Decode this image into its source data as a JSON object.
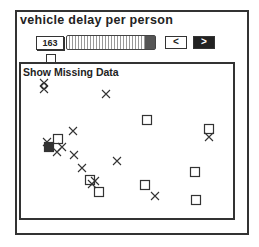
{
  "panel": {
    "title": "vehicle delay per person",
    "value": "163",
    "slider": {
      "position_pct": 90
    },
    "prev_label": "<",
    "next_label": ">",
    "checkbox_checked": false
  },
  "plot": {
    "label": "Show Missing Data",
    "colors": {
      "ink": "#333333",
      "background": "#ffffff"
    }
  },
  "chart_data": {
    "type": "scatter",
    "title": "Show Missing Data",
    "xlabel": "",
    "ylabel": "",
    "grid": false,
    "series": [
      {
        "name": "squares",
        "marker": "square-open",
        "points": [
          [
            147,
            120
          ],
          [
            209,
            129
          ],
          [
            58,
            139
          ],
          [
            90,
            180
          ],
          [
            99,
            192
          ],
          [
            145,
            185
          ],
          [
            195,
            172
          ],
          [
            196,
            200
          ]
        ]
      },
      {
        "name": "filled-square",
        "marker": "square-filled",
        "points": [
          [
            49,
            147
          ]
        ]
      },
      {
        "name": "crosses",
        "marker": "x",
        "points": [
          [
            44,
            83
          ],
          [
            44,
            89
          ],
          [
            106,
            94
          ],
          [
            73,
            131
          ],
          [
            47,
            142
          ],
          [
            62,
            147
          ],
          [
            57,
            152
          ],
          [
            74,
            155
          ],
          [
            117,
            161
          ],
          [
            82,
            168
          ],
          [
            95,
            181
          ],
          [
            92,
            184
          ],
          [
            155,
            196
          ],
          [
            209,
            137
          ]
        ]
      },
      {
        "name": "circle",
        "marker": "circle-open",
        "points": [
          [
            44,
            86
          ]
        ]
      }
    ]
  },
  "caption": "Figure 2.1 ..."
}
